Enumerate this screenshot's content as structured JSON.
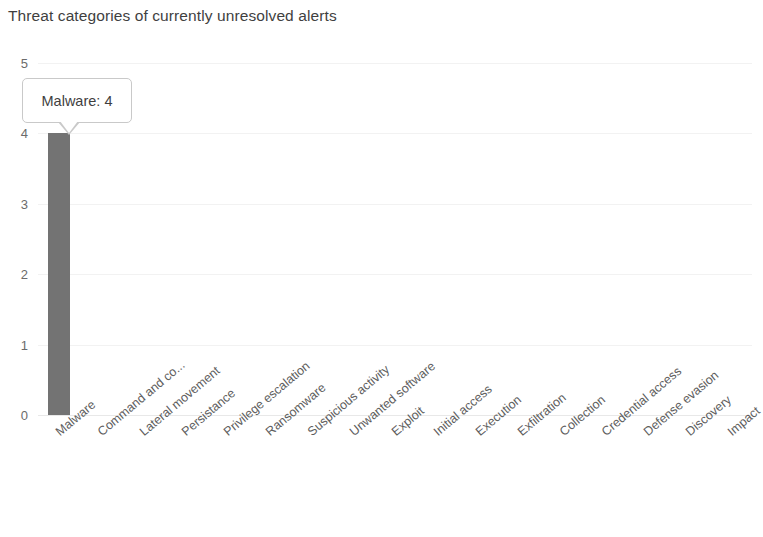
{
  "chart_data": {
    "type": "bar",
    "title": "Threat categories of currently unresolved alerts",
    "xlabel": "",
    "ylabel": "",
    "ylim": [
      0,
      5
    ],
    "ytick_labels": [
      "5",
      "4",
      "3",
      "2",
      "1",
      "0"
    ],
    "ytick_values": [
      5,
      4,
      3,
      2,
      1,
      0
    ],
    "grid": true,
    "legend": false,
    "bar_color": "#737373",
    "categories": [
      "Malware",
      "Command and co...",
      "Lateral movement",
      "Persistance",
      "Privilege escalation",
      "Ransomware",
      "Suspicious activity",
      "Unwanted software",
      "Exploit",
      "Initial access",
      "Execution",
      "Exfiltration",
      "Collection",
      "Credential access",
      "Defense evasion",
      "Discovery",
      "Impact"
    ],
    "values": [
      4,
      0,
      0,
      0,
      0,
      0,
      0,
      0,
      0,
      0,
      0,
      0,
      0,
      0,
      0,
      0,
      0
    ],
    "annotations": [
      {
        "name": "tooltip",
        "category": "Malware",
        "value": 4,
        "text": "Malware: 4"
      }
    ]
  },
  "tooltip": {
    "label": "Malware: 4"
  },
  "colors": {
    "bar": "#737373",
    "gridline": "#f2f2f2",
    "title_text": "#3f3f3f",
    "tick_text": "#5d5d5d",
    "tooltip_border": "#c9c9c9"
  }
}
